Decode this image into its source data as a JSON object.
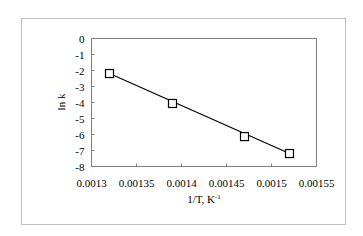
{
  "chart_data": {
    "type": "scatter",
    "title": "",
    "xlabel": "1/T, K",
    "xlabel_superscript": "-1",
    "ylabel": "ln k",
    "xlim": [
      0.0013,
      0.00155
    ],
    "ylim": [
      -8,
      0
    ],
    "x_ticks": [
      0.0013,
      0.00135,
      0.0014,
      0.00145,
      0.0015,
      0.00155
    ],
    "x_tick_labels": [
      "0.0013",
      "0.00135",
      "0.0014",
      "0.00145",
      "0.0015",
      "0.00155"
    ],
    "y_ticks": [
      0,
      -1,
      -2,
      -3,
      -4,
      -5,
      -6,
      -7,
      -8
    ],
    "y_tick_labels": [
      "0",
      "-1",
      "-2",
      "-3",
      "-4",
      "-5",
      "-6",
      "-7",
      "-8"
    ],
    "grid": false,
    "legend": null,
    "series": [
      {
        "name": "ln k vs 1/T",
        "marker": "open-square",
        "x": [
          0.00132,
          0.00139,
          0.00147,
          0.00152
        ],
        "y": [
          -2.19,
          -4.06,
          -6.13,
          -7.19
        ]
      }
    ],
    "trendline": {
      "type": "linear",
      "x": [
        0.00132,
        0.00152
      ],
      "y": [
        -2.19,
        -7.19
      ]
    }
  },
  "colors": {
    "frame": "#bfbfbf",
    "plot_border": "#808080",
    "line": "#000000",
    "marker": "#000000"
  }
}
